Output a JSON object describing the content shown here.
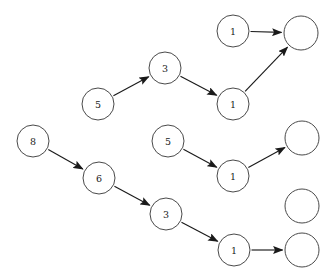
{
  "diagram": {
    "kind": "directed-node-graph",
    "canvas": {
      "width": 334,
      "height": 279,
      "background": "#ffffff"
    },
    "style": {
      "node_radius": 16,
      "node_fill": "#ffffff",
      "node_stroke": "#4a4a4a",
      "edge_color": "#1a1a1a",
      "label_color": "#1a1a1a"
    },
    "nodes": [
      {
        "id": "n1",
        "label": "1",
        "cx": 233,
        "cy": 31,
        "r": 16,
        "empty": false
      },
      {
        "id": "n2",
        "label": "",
        "cx": 301,
        "cy": 33,
        "r": 17,
        "empty": true
      },
      {
        "id": "n3",
        "label": "3",
        "cx": 165,
        "cy": 68,
        "r": 16,
        "empty": false
      },
      {
        "id": "n4",
        "label": "5",
        "cx": 98,
        "cy": 104,
        "r": 16,
        "empty": false
      },
      {
        "id": "n5",
        "label": "1",
        "cx": 233,
        "cy": 104,
        "r": 16,
        "empty": false
      },
      {
        "id": "n6",
        "label": "8",
        "cx": 33,
        "cy": 141,
        "r": 16,
        "empty": false
      },
      {
        "id": "n7",
        "label": "5",
        "cx": 168,
        "cy": 141,
        "r": 16,
        "empty": false
      },
      {
        "id": "n8",
        "label": "",
        "cx": 302,
        "cy": 138,
        "r": 17,
        "empty": true
      },
      {
        "id": "n9",
        "label": "6",
        "cx": 99,
        "cy": 178,
        "r": 16,
        "empty": false
      },
      {
        "id": "n10",
        "label": "1",
        "cx": 233,
        "cy": 176,
        "r": 16,
        "empty": false
      },
      {
        "id": "n11",
        "label": "3",
        "cx": 166,
        "cy": 214,
        "r": 16,
        "empty": false
      },
      {
        "id": "n12",
        "label": "",
        "cx": 302,
        "cy": 206,
        "r": 17,
        "empty": true
      },
      {
        "id": "n13",
        "label": "1",
        "cx": 234,
        "cy": 250,
        "r": 16,
        "empty": false
      },
      {
        "id": "n14",
        "label": "",
        "cx": 302,
        "cy": 250,
        "r": 17,
        "empty": true
      }
    ],
    "edges": [
      {
        "id": "e1",
        "from": "n1",
        "to": "n2",
        "from_label": "1",
        "to_label": ""
      },
      {
        "id": "e2",
        "from": "n4",
        "to": "n3",
        "from_label": "5",
        "to_label": "3"
      },
      {
        "id": "e3",
        "from": "n3",
        "to": "n5",
        "from_label": "3",
        "to_label": "1"
      },
      {
        "id": "e4",
        "from": "n5",
        "to": "n2",
        "from_label": "1",
        "to_label": ""
      },
      {
        "id": "e5",
        "from": "n7",
        "to": "n10",
        "from_label": "5",
        "to_label": "1"
      },
      {
        "id": "e6",
        "from": "n10",
        "to": "n8",
        "from_label": "1",
        "to_label": ""
      },
      {
        "id": "e7",
        "from": "n6",
        "to": "n9",
        "from_label": "8",
        "to_label": "6"
      },
      {
        "id": "e8",
        "from": "n9",
        "to": "n11",
        "from_label": "6",
        "to_label": "3"
      },
      {
        "id": "e9",
        "from": "n11",
        "to": "n13",
        "from_label": "3",
        "to_label": "1"
      },
      {
        "id": "e10",
        "from": "n13",
        "to": "n14",
        "from_label": "1",
        "to_label": ""
      }
    ]
  }
}
